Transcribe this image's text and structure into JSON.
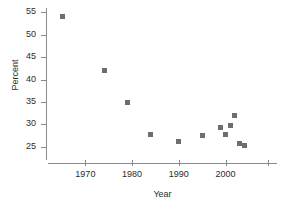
{
  "chart_data": {
    "type": "scatter",
    "title": "",
    "xlabel": "Year",
    "ylabel": "Percent",
    "xlim": [
      1962,
      2011
    ],
    "ylim": [
      22,
      56
    ],
    "grid": false,
    "legend": "none",
    "marker_color": "#6e6e6e",
    "axis_color": "#8a8a8a",
    "x_ticks": [
      {
        "value": 1970,
        "label": "1970"
      },
      {
        "value": 1980,
        "label": "1980"
      },
      {
        "value": 1990,
        "label": "1990"
      },
      {
        "value": 2000,
        "label": "2000"
      },
      {
        "value": 2009,
        "label": ""
      }
    ],
    "y_ticks": [
      {
        "value": 55,
        "label": "55"
      },
      {
        "value": 50,
        "label": "50"
      },
      {
        "value": 45,
        "label": "45"
      },
      {
        "value": 40,
        "label": "40"
      },
      {
        "value": 35,
        "label": "35"
      },
      {
        "value": 30,
        "label": "30"
      },
      {
        "value": 25,
        "label": "25"
      }
    ],
    "series": [
      {
        "name": "Percent",
        "points": [
          {
            "x": 1965,
            "y": 54.0
          },
          {
            "x": 1974,
            "y": 42.0
          },
          {
            "x": 1979,
            "y": 34.9
          },
          {
            "x": 1984,
            "y": 27.8
          },
          {
            "x": 1990,
            "y": 26.2
          },
          {
            "x": 1995,
            "y": 27.4
          },
          {
            "x": 1999,
            "y": 29.3
          },
          {
            "x": 2000,
            "y": 27.6
          },
          {
            "x": 2001,
            "y": 29.8
          },
          {
            "x": 2002,
            "y": 31.9
          },
          {
            "x": 2003,
            "y": 25.6
          },
          {
            "x": 2004,
            "y": 25.3
          }
        ]
      }
    ]
  }
}
